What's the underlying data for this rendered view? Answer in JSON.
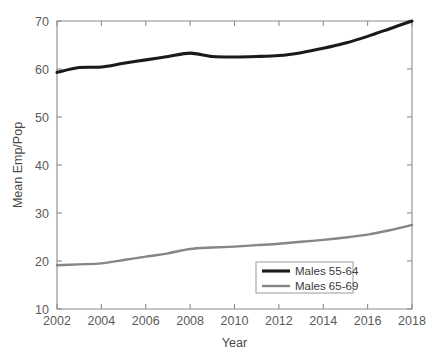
{
  "chart_data": {
    "type": "line",
    "title": "",
    "xlabel": "Year",
    "ylabel": "Mean Emp/Pop",
    "xlim": [
      2002,
      2018
    ],
    "ylim": [
      10,
      70
    ],
    "xticks": [
      2002,
      2004,
      2006,
      2008,
      2010,
      2012,
      2014,
      2016,
      2018
    ],
    "xticklabels": [
      "2002",
      "2004",
      "2006",
      "2008",
      "2010",
      "2012",
      "2014",
      "2016",
      "2018"
    ],
    "yticks": [
      10,
      20,
      30,
      40,
      50,
      60,
      70
    ],
    "yticklabels": [
      "10",
      "20",
      "30",
      "40",
      "50",
      "60",
      "70"
    ],
    "grid": false,
    "legend_position": "lower right",
    "x": [
      2002,
      2003,
      2004,
      2005,
      2006,
      2007,
      2008,
      2009,
      2010,
      2011,
      2012,
      2013,
      2014,
      2015,
      2016,
      2017,
      2018
    ],
    "series": [
      {
        "name": "Males 55-64",
        "color": "#1a1a1a",
        "width": 3.1,
        "values": [
          59.3,
          60.3,
          60.4,
          61.2,
          61.9,
          62.6,
          63.3,
          62.6,
          62.5,
          62.6,
          62.8,
          63.4,
          64.3,
          65.4,
          66.8,
          68.4,
          70.0
        ]
      },
      {
        "name": "Males 65-69",
        "color": "#868686",
        "width": 2.4,
        "values": [
          19.1,
          19.3,
          19.5,
          20.2,
          20.9,
          21.6,
          22.5,
          22.8,
          23.0,
          23.3,
          23.6,
          24.0,
          24.4,
          24.9,
          25.5,
          26.4,
          27.5
        ]
      }
    ]
  },
  "legend": {
    "entries": [
      {
        "label": "Males 55-64"
      },
      {
        "label": "Males 65-69"
      }
    ]
  }
}
